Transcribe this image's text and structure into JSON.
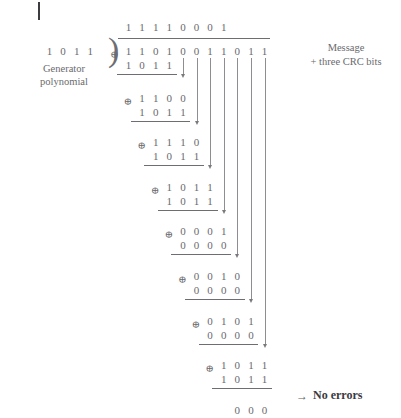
{
  "figure": {
    "type": "crc-long-division",
    "title_bar_present": true,
    "generator": {
      "label_line1": "Generator",
      "label_line2": "polynomial",
      "bits": [
        "1",
        "0",
        "1",
        "1"
      ]
    },
    "message": {
      "label_line1": "Message",
      "label_line2": "+ three CRC bits",
      "bits": [
        "1",
        "1",
        "0",
        "1",
        "0",
        "0",
        "1",
        "1",
        "0",
        "1",
        "1"
      ]
    },
    "quotient": {
      "bits": [
        "1",
        "1",
        "1",
        "1",
        "0",
        "0",
        "0",
        "1"
      ]
    },
    "xor_symbol": "⊕",
    "steps": [
      {
        "index": 1,
        "shift": 0,
        "top_bits": [
          "1",
          "1",
          "0",
          "1"
        ],
        "divisor_bits": [
          "1",
          "0",
          "1",
          "1"
        ],
        "has_xor": true
      },
      {
        "index": 2,
        "shift": 1,
        "top_bits": [
          "1",
          "1",
          "0",
          "0"
        ],
        "divisor_bits": [
          "1",
          "0",
          "1",
          "1"
        ],
        "has_xor": true
      },
      {
        "index": 3,
        "shift": 2,
        "top_bits": [
          "1",
          "1",
          "1",
          "0"
        ],
        "divisor_bits": [
          "1",
          "0",
          "1",
          "1"
        ],
        "has_xor": true
      },
      {
        "index": 4,
        "shift": 3,
        "top_bits": [
          "1",
          "0",
          "1",
          "1"
        ],
        "divisor_bits": [
          "1",
          "0",
          "1",
          "1"
        ],
        "has_xor": true
      },
      {
        "index": 5,
        "shift": 4,
        "top_bits": [
          "0",
          "0",
          "0",
          "1"
        ],
        "divisor_bits": [
          "0",
          "0",
          "0",
          "0"
        ],
        "has_xor": true
      },
      {
        "index": 6,
        "shift": 5,
        "top_bits": [
          "0",
          "0",
          "1",
          "0"
        ],
        "divisor_bits": [
          "0",
          "0",
          "0",
          "0"
        ],
        "has_xor": true
      },
      {
        "index": 7,
        "shift": 6,
        "top_bits": [
          "0",
          "1",
          "0",
          "1"
        ],
        "divisor_bits": [
          "0",
          "0",
          "0",
          "0"
        ],
        "has_xor": true
      },
      {
        "index": 8,
        "shift": 7,
        "top_bits": [
          "1",
          "0",
          "1",
          "1"
        ],
        "divisor_bits": [
          "1",
          "0",
          "1",
          "1"
        ],
        "has_xor": true
      }
    ],
    "remainder": {
      "bits": [
        "0",
        "0",
        "0"
      ],
      "conclusion_arrow": "→",
      "conclusion_text": "No errors"
    }
  }
}
